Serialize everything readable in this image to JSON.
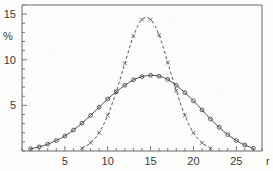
{
  "chart_data": {
    "type": "line",
    "title": "",
    "subtitle": "",
    "xlabel": "r",
    "ylabel": "%",
    "xlim": [
      0,
      28
    ],
    "ylim": [
      0,
      16
    ],
    "x_ticks_major": [
      5,
      10,
      15,
      20,
      25
    ],
    "x_tick_labels": [
      "5",
      "10",
      "15",
      "20",
      "25"
    ],
    "x_ticks_minor_step": 1,
    "y_ticks_major": [
      5,
      10,
      15
    ],
    "y_tick_labels": [
      "5",
      "10",
      "15"
    ],
    "y_ticks_minor_step": 1,
    "grid": false,
    "legend_position": "none",
    "series": [
      {
        "name": "broad-distribution",
        "style": "solid",
        "marker": "open-circle",
        "x": [
          1,
          2,
          3,
          4,
          5,
          6,
          7,
          8,
          9,
          10,
          11,
          12,
          13,
          14,
          15,
          16,
          17,
          18,
          19,
          20,
          21,
          22,
          23,
          24,
          25,
          26,
          27
        ],
        "y": [
          0.25,
          0.45,
          0.75,
          1.15,
          1.65,
          2.3,
          3.05,
          3.9,
          4.8,
          5.7,
          6.5,
          7.2,
          7.8,
          8.15,
          8.3,
          8.2,
          7.85,
          7.2,
          6.4,
          5.5,
          4.5,
          3.5,
          2.6,
          1.8,
          1.15,
          0.65,
          0.3
        ]
      },
      {
        "name": "narrow-distribution",
        "style": "dashed",
        "marker": "cross",
        "x": [
          7,
          8,
          9,
          10,
          11,
          12,
          13,
          14,
          15,
          16,
          17,
          18,
          19,
          20,
          21,
          22
        ],
        "y": [
          0.3,
          0.9,
          2.0,
          3.9,
          6.5,
          9.6,
          12.6,
          14.4,
          14.4,
          12.7,
          9.7,
          6.6,
          3.9,
          2.0,
          0.9,
          0.3
        ]
      }
    ],
    "annotations": []
  }
}
